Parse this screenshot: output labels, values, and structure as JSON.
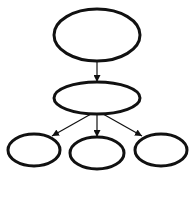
{
  "diagram": {
    "type": "tree",
    "background": "#ffffff",
    "stroke_color": "#111111",
    "node_stroke_width": 3,
    "edge_stroke_width": 1.2,
    "nodes": [
      {
        "id": "root",
        "label": "",
        "cx": 97,
        "cy": 35,
        "rx": 43,
        "ry": 26
      },
      {
        "id": "middle",
        "label": "",
        "cx": 97,
        "cy": 98,
        "rx": 43,
        "ry": 16
      },
      {
        "id": "left",
        "label": "",
        "cx": 34,
        "cy": 150,
        "rx": 26,
        "ry": 16
      },
      {
        "id": "center",
        "label": "",
        "cx": 97,
        "cy": 153,
        "rx": 27,
        "ry": 16
      },
      {
        "id": "right",
        "label": "",
        "cx": 161,
        "cy": 150,
        "rx": 26,
        "ry": 16
      }
    ],
    "edges": [
      {
        "from": "root",
        "to": "middle",
        "x1": 97,
        "y1": 61,
        "x2": 97,
        "y2": 82
      },
      {
        "from": "middle",
        "to": "left",
        "x1": 91,
        "y1": 114,
        "x2": 52,
        "y2": 136
      },
      {
        "from": "middle",
        "to": "center",
        "x1": 97,
        "y1": 114,
        "x2": 97,
        "y2": 137
      },
      {
        "from": "middle",
        "to": "right",
        "x1": 103,
        "y1": 114,
        "x2": 142,
        "y2": 136
      }
    ]
  }
}
